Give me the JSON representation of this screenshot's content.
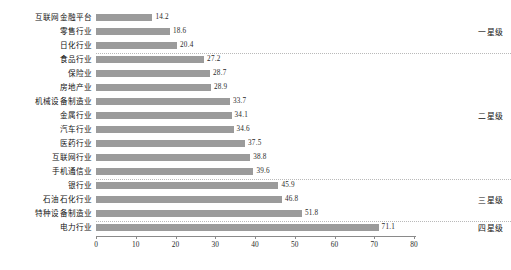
{
  "chart_data": {
    "type": "bar",
    "orientation": "horizontal",
    "title": "",
    "xlabel": "",
    "ylabel": "",
    "xlim": [
      0,
      80
    ],
    "xticks": [
      0,
      10,
      20,
      30,
      40,
      50,
      60,
      70,
      80
    ],
    "grid": false,
    "legend": "none",
    "bar_color": "#9b9b9b",
    "categories": [
      "互联网金融平台",
      "零售行业",
      "日化行业",
      "食品行业",
      "保险业",
      "房地产业",
      "机械设备制造业",
      "金属行业",
      "汽车行业",
      "医药行业",
      "互联网行业",
      "手机通信业",
      "银行业",
      "石油石化行业",
      "特种设备制造业",
      "电力行业"
    ],
    "values": [
      14.2,
      18.6,
      20.4,
      27.2,
      28.7,
      28.9,
      33.7,
      34.1,
      34.6,
      37.5,
      38.8,
      39.6,
      45.9,
      46.8,
      51.8,
      71.1
    ],
    "value_labels": [
      "14.2",
      "18.6",
      "20.4",
      "27.2",
      "28.7",
      "28.9",
      "33.7",
      "34.1",
      "34.6",
      "37.5",
      "38.8",
      "39.6",
      "45.9",
      "46.8",
      "51.8",
      "71.1"
    ],
    "annotations": [
      {
        "label": "一星级",
        "after_index": 2
      },
      {
        "label": "二星级",
        "after_index": 11
      },
      {
        "label": "三星级",
        "after_index": 14
      },
      {
        "label": "四星级",
        "after_index": 15
      }
    ]
  },
  "tier_labels": {
    "one_star": "一星级",
    "two_star": "二星级",
    "three_star": "三星级",
    "four_star": "四星级"
  },
  "axis": {
    "tick_0": "0",
    "tick_10": "10",
    "tick_20": "20",
    "tick_30": "30",
    "tick_40": "40",
    "tick_50": "50",
    "tick_60": "60",
    "tick_70": "70",
    "tick_80": "80"
  }
}
